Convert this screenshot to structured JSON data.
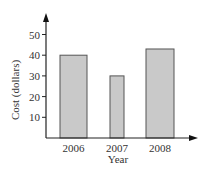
{
  "chart_data": {
    "type": "bar",
    "title": "",
    "xlabel": "Year",
    "ylabel": "Cost (dollars)",
    "categories": [
      "2006",
      "2007",
      "2008"
    ],
    "values": [
      40,
      30,
      43
    ],
    "yticks": [
      10,
      20,
      30,
      40,
      50
    ],
    "ylim": [
      0,
      55
    ],
    "grid": false,
    "legend": null,
    "colors": {
      "bar_fill": "#c9c9c9",
      "bar_stroke": "#555555",
      "axis": "#222222"
    }
  }
}
